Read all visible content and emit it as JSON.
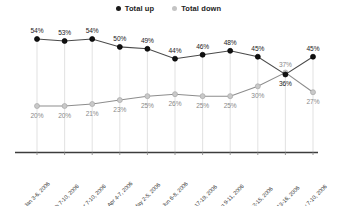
{
  "legend": {
    "position": "top-center",
    "items": [
      {
        "label": "Total up",
        "color": "#1a1a1a",
        "marker": "filled-circle-icon"
      },
      {
        "label": "Total down",
        "color": "#c4c4c4",
        "marker": "filled-circle-icon"
      }
    ]
  },
  "colors": {
    "up_line": "#4a4a4a",
    "up_marker": "#111111",
    "down_line": "#8d8d8d",
    "down_marker": "#c9c9c9",
    "gridline": "#e4e4e4",
    "axis": "#3c3c3c",
    "background": "#ffffff"
  },
  "chart_data": {
    "type": "line",
    "title": "",
    "subtitle": "",
    "xlabel": "",
    "ylabel": "",
    "ylim": [
      0,
      60
    ],
    "grid": "vertical-only",
    "legend_position": "top-center",
    "categories": [
      "Jan 3-6, 2006",
      "Feb 7-10, 2006",
      "Mar 7-10, 2006",
      "Apr 4-7, 2006",
      "May 2-5, 2006",
      "Jun 6-8, 2006",
      "Jul 17-19, 2006",
      "Aug 9-11, 2006",
      "Sep 12-15, 2006",
      "Oct 13-16, 2006",
      "Nov 7-10, 2006"
    ],
    "series": [
      {
        "name": "Total up",
        "values": [
          54,
          53,
          54,
          50,
          49,
          44,
          46,
          48,
          45,
          36,
          45
        ],
        "labels": [
          "54%",
          "53%",
          "54%",
          "50%",
          "49%",
          "44%",
          "46%",
          "48%",
          "45%",
          "36%",
          "45%"
        ]
      },
      {
        "name": "Total down",
        "values": [
          20,
          20,
          21,
          23,
          25,
          26,
          25,
          25,
          30,
          37,
          27
        ],
        "labels": [
          "20%",
          "20%",
          "21%",
          "23%",
          "25%",
          "26%",
          "25%",
          "25%",
          "30%",
          "37%",
          "27%"
        ]
      }
    ]
  }
}
